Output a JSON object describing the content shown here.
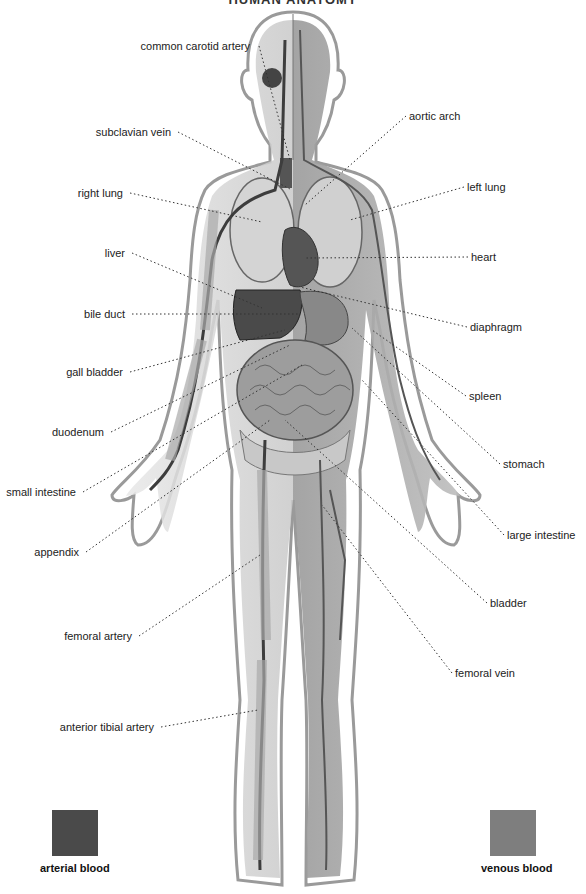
{
  "title": "HUMAN ANATOMY",
  "labels_left": [
    {
      "text": "common carotid artery",
      "x": 256,
      "y": 46,
      "tx": 290,
      "ty": 160
    },
    {
      "text": "subclavian vein",
      "x": 175,
      "y": 132,
      "tx": 292,
      "ty": 190
    },
    {
      "text": "right lung",
      "x": 127,
      "y": 193,
      "tx": 262,
      "ty": 222
    },
    {
      "text": "liver",
      "x": 129,
      "y": 253,
      "tx": 262,
      "ty": 308
    },
    {
      "text": "bile duct",
      "x": 129,
      "y": 314,
      "tx": 298,
      "ty": 314
    },
    {
      "text": "gall bladder",
      "x": 127,
      "y": 372,
      "tx": 285,
      "ty": 330
    },
    {
      "text": "duodenum",
      "x": 108,
      "y": 432,
      "tx": 290,
      "ty": 345
    },
    {
      "text": "small intestine",
      "x": 80,
      "y": 492,
      "tx": 302,
      "ty": 365
    },
    {
      "text": "appendix",
      "x": 83,
      "y": 552,
      "tx": 270,
      "ty": 420
    },
    {
      "text": "femoral artery",
      "x": 136,
      "y": 636,
      "tx": 260,
      "ty": 555
    },
    {
      "text": "anterior tibial artery",
      "x": 158,
      "y": 727,
      "tx": 258,
      "ty": 710
    }
  ],
  "labels_right": [
    {
      "text": "aortic arch",
      "x": 409,
      "y": 116,
      "tx": 305,
      "ty": 205
    },
    {
      "text": "left lung",
      "x": 467,
      "y": 187,
      "tx": 350,
      "ty": 220
    },
    {
      "text": "heart",
      "x": 471,
      "y": 257,
      "tx": 305,
      "ty": 258
    },
    {
      "text": "diaphragm",
      "x": 470,
      "y": 327,
      "tx": 300,
      "ty": 287
    },
    {
      "text": "spleen",
      "x": 469,
      "y": 396,
      "tx": 372,
      "ty": 330
    },
    {
      "text": "stomach",
      "x": 503,
      "y": 464,
      "tx": 352,
      "ty": 328
    },
    {
      "text": "large intestine",
      "x": 507,
      "y": 535,
      "tx": 362,
      "ty": 380
    },
    {
      "text": "bladder",
      "x": 490,
      "y": 603,
      "tx": 285,
      "ty": 420
    },
    {
      "text": "femoral vein",
      "x": 455,
      "y": 673,
      "tx": 322,
      "ty": 505
    }
  ],
  "legend": [
    {
      "label": "arterial blood",
      "color": "#4a4a4a",
      "swatch_x": 52,
      "swatch_y": 810,
      "label_x": 40,
      "label_y": 868
    },
    {
      "label": "venous blood",
      "color": "#7e7e7e",
      "swatch_x": 490,
      "swatch_y": 810,
      "label_x": 481,
      "label_y": 868
    }
  ]
}
